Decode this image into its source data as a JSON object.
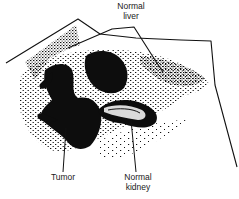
{
  "figure": {
    "type": "anatomical-diagram",
    "labels": {
      "liver": {
        "line1": "Normal",
        "line2": "liver"
      },
      "tumor": {
        "line1": "Tumor"
      },
      "kidney": {
        "line1": "Normal",
        "line2": "kidney"
      }
    },
    "colors": {
      "ink": "#111111",
      "background": "#ffffff"
    }
  }
}
